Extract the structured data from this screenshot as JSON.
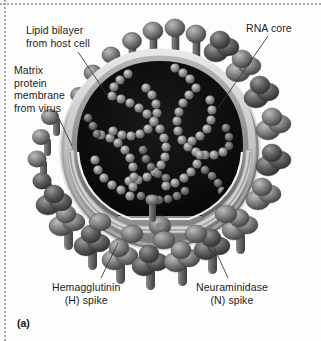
{
  "figure": {
    "marker": "(a)",
    "style": "grayscale scientific illustration",
    "background_color": "#fdfdfd",
    "border": {
      "style": "dotted",
      "color": "#9a9a9a",
      "edges": "top and left"
    }
  },
  "labels": {
    "lipid_bilayer": "Lipid bilayer\nfrom host cell",
    "matrix_protein": "Matrix\nprotein\nmembrane\nfrom virus",
    "rna_core": "RNA core",
    "hemagglutinin": "Hemagglutinin\n(H) spike",
    "neuraminidase": "Neuraminidase\n(N) spike"
  },
  "colors": {
    "text": "#1c1c1c",
    "leader_line": "#3a3a3a",
    "core_interior": "#0b0b0b",
    "rna_strand_light": "#c9c9c9",
    "rna_strand_mid": "#8d8d8d",
    "rna_strand_dark": "#5a5a5a",
    "membrane_outer": "#d8d8d8",
    "membrane_mid": "#a8a8a8",
    "membrane_inner": "#6f6f6f",
    "spike_light": "#a6a6a6",
    "spike_mid": "#757575",
    "spike_dark": "#4a4a4a",
    "spike_shadow": "#3a3a3a"
  },
  "structures": [
    {
      "name": "lipid-bilayer",
      "description": "outer host-cell-derived membrane ring"
    },
    {
      "name": "matrix-protein-membrane",
      "description": "inner viral matrix protein layer"
    },
    {
      "name": "rna-core",
      "description": "beaded helical RNA segments in dark interior"
    },
    {
      "name": "hemagglutinin-spike",
      "description": "rod-and-knob surface glycoprotein spikes"
    },
    {
      "name": "neuraminidase-spike",
      "description": "mushroom-head surface glycoprotein spikes"
    }
  ]
}
